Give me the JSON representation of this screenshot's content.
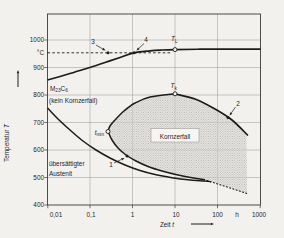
{
  "colors": {
    "background": "#f2f1ee",
    "frame": "#3b3b3b",
    "grid": "#8c8c8c",
    "curve": "#1c1c1c",
    "halftone_dot": "#a8a7a3",
    "halftone_bg": "#e6e5e1",
    "label_box_bg": "#f6f5f2"
  },
  "axes": {
    "x": {
      "label": "Zeit t",
      "unit": "h",
      "scale": "log",
      "tick_labels": [
        "0,01",
        "0,1",
        "1",
        "10",
        "100",
        "1000"
      ]
    },
    "y": {
      "label": "Temperatur T",
      "unit": "°C",
      "scale": "linear",
      "tick_labels": [
        "1000",
        "900",
        "800",
        "700",
        "600",
        "500",
        "400"
      ]
    }
  },
  "chart_data": {
    "type": "line",
    "title": "",
    "xlabel": "Zeit t",
    "x_unit": "h",
    "x_scale": "log",
    "xlim": [
      0.01,
      1000
    ],
    "ylabel": "Temperatur T",
    "y_unit": "°C",
    "ylim": [
      400,
      1100
    ],
    "grid": true,
    "series": [
      {
        "name": "M23C6-Loesungsgrenze (obere Kurve, kein Kornzerfall)",
        "style": "solid",
        "points": [
          [
            0.01,
            855
          ],
          [
            0.04,
            885
          ],
          [
            0.1,
            900
          ],
          [
            0.3,
            925
          ],
          [
            1.1,
            950
          ],
          [
            2.5,
            960
          ],
          [
            10,
            962
          ],
          [
            100,
            963
          ],
          [
            1000,
            963
          ]
        ]
      },
      {
        "name": "Loesungsgluehtemperatur ca. 950 °C (gestrichelte Linie)",
        "style": "dashed",
        "points": [
          [
            0.01,
            950
          ],
          [
            8,
            950
          ]
        ]
      },
      {
        "name": "Grenze uebersaettigter Austenit",
        "style": "solid",
        "points": [
          [
            0.01,
            753
          ],
          [
            0.018,
            713
          ],
          [
            0.034,
            673
          ],
          [
            0.068,
            633
          ],
          [
            0.14,
            600
          ],
          [
            0.3,
            571
          ],
          [
            0.66,
            545
          ],
          [
            1.5,
            525
          ],
          [
            3.4,
            511
          ],
          [
            8.5,
            499
          ],
          [
            20,
            492
          ],
          [
            51,
            487
          ]
        ]
      },
      {
        "name": "Kornzerfall-Grenzkurve 1 (C-Kurve mit Nase t_min)",
        "style": "solid",
        "points": [
          [
            10,
            804
          ],
          [
            2.6,
            793
          ],
          [
            1.15,
            771
          ],
          [
            0.63,
            742
          ],
          [
            0.39,
            709
          ],
          [
            0.3,
            687
          ],
          [
            0.27,
            667
          ],
          [
            0.33,
            636
          ],
          [
            0.46,
            607
          ],
          [
            0.7,
            582
          ],
          [
            1.2,
            560
          ],
          [
            2.3,
            540
          ],
          [
            5,
            524
          ],
          [
            12,
            509
          ],
          [
            25,
            499
          ],
          [
            51,
            492
          ]
        ]
      },
      {
        "name": "Kornzerfall-Grenzkurve 2 (rechte Flanke)",
        "style": "solid",
        "points": [
          [
            10,
            804
          ],
          [
            30,
            785
          ],
          [
            87,
            749
          ],
          [
            218,
            709
          ],
          [
            520,
            653
          ]
        ]
      },
      {
        "name": "untere Grenze (punktiert)",
        "style": "dotted",
        "points": [
          [
            70,
            485
          ],
          [
            500,
            442
          ]
        ]
      }
    ],
    "annotations": [
      {
        "label": "3",
        "t_h": 0.25,
        "T_C": 950,
        "marker": "filled-dot"
      },
      {
        "label": "4",
        "t_h": 1.1,
        "T_C": 950,
        "marker": "filled-dot"
      },
      {
        "label": "T_L",
        "t_h": 10,
        "T_C": 962,
        "marker": "open-circle"
      },
      {
        "label": "T_k",
        "t_h": 10,
        "T_C": 804,
        "marker": "open-circle"
      },
      {
        "label": "t_min",
        "t_h": 0.27,
        "T_C": 667,
        "marker": "open-circle"
      },
      {
        "label": "1",
        "t_h": 0.74,
        "T_C": 578,
        "marker": "filled-dot"
      },
      {
        "label": "2",
        "t_h": 177,
        "T_C": 718,
        "marker": "filled-dot"
      },
      {
        "label": "M23C6",
        "kind": "phase-label"
      },
      {
        "label": "(kein Kornzerfall)",
        "kind": "region-label"
      },
      {
        "label": "Kornzerfall",
        "kind": "region-label-boxed"
      },
      {
        "label": "übersättigter Austenit",
        "kind": "region-label"
      }
    ]
  },
  "figure": {
    "width": 284,
    "height": 238,
    "plot": {
      "x0": 47.5,
      "y0": 14,
      "x1": 260.5,
      "y1": 205
    },
    "grid_x": [
      90,
      132.5,
      175,
      217.5
    ],
    "grid_y": [
      40,
      67.5,
      95,
      122.5,
      150,
      177.5
    ],
    "xticks": [
      {
        "x": 56,
        "label": "0,01",
        "tick": 47.8
      },
      {
        "x": 91,
        "label": "0,1",
        "tick": 90
      },
      {
        "x": 132.5,
        "label": "1",
        "tick": 132.5
      },
      {
        "x": 176,
        "label": "10",
        "tick": 175
      },
      {
        "x": 217.5,
        "label": "100",
        "tick": 217.5
      },
      {
        "x": 237,
        "label": "h"
      },
      {
        "x": 259,
        "label": "1000",
        "tick": 260.2
      }
    ],
    "yticks": [
      {
        "y": 40,
        "label": "1000",
        "tick": 1
      },
      {
        "y": 53,
        "label": "°C"
      },
      {
        "y": 67.5,
        "label": "900",
        "tick": 1
      },
      {
        "y": 95,
        "label": "800",
        "tick": 1
      },
      {
        "y": 122.5,
        "label": "700",
        "tick": 1
      },
      {
        "y": 150,
        "label": "600",
        "tick": 1
      },
      {
        "y": 177.5,
        "label": "500",
        "tick": 1
      },
      {
        "y": 205,
        "label": "400",
        "tick": 1
      }
    ],
    "curves": [
      {
        "name": "upper-solvus-curve",
        "stroke": 1.7,
        "smooth": true,
        "points": [
          [
            47.5,
            80
          ],
          [
            60,
            76.5
          ],
          [
            75,
            72
          ],
          [
            90,
            67.5
          ],
          [
            105,
            62.5
          ],
          [
            120,
            57.5
          ],
          [
            134,
            52.8
          ],
          [
            150,
            50.8
          ],
          [
            162,
            50
          ],
          [
            175,
            49.6
          ],
          [
            200,
            49.2
          ],
          [
            230,
            49.2
          ],
          [
            260.5,
            49.2
          ]
        ]
      },
      {
        "name": "solution-temperature-dashed-line",
        "stroke": 0.9,
        "dash": "2.6,2.2",
        "points": [
          [
            47.5,
            52.8
          ],
          [
            171,
            52.8
          ]
        ]
      },
      {
        "name": "supersaturated-austenite-curve",
        "stroke": 1.5,
        "smooth": true,
        "points": [
          [
            47.5,
            108
          ],
          [
            58,
            119
          ],
          [
            70,
            130
          ],
          [
            83,
            141
          ],
          [
            96,
            150
          ],
          [
            110,
            158
          ],
          [
            125,
            165
          ],
          [
            140,
            170.5
          ],
          [
            155,
            174.5
          ],
          [
            172,
            177.7
          ],
          [
            188,
            179.8
          ],
          [
            205,
            181
          ],
          [
            211,
            181.8
          ]
        ]
      },
      {
        "name": "c-curve-left-flank",
        "stroke": 1.5,
        "smooth": true,
        "points": [
          [
            175,
            93.8
          ],
          [
            150,
            97
          ],
          [
            135,
            103
          ],
          [
            124,
            111
          ],
          [
            115,
            120
          ],
          [
            110,
            126
          ],
          [
            108,
            131.5
          ]
        ]
      },
      {
        "name": "c-curve-lower-branch",
        "stroke": 1.5,
        "smooth": true,
        "points": [
          [
            108,
            131.5
          ],
          [
            112,
            140
          ],
          [
            118,
            148
          ],
          [
            126,
            155
          ],
          [
            136,
            161
          ],
          [
            148,
            166.5
          ],
          [
            162,
            171
          ],
          [
            178,
            175
          ],
          [
            192,
            177.8
          ],
          [
            205,
            179.8
          ]
        ]
      },
      {
        "name": "c-curve-right-flank",
        "stroke": 1.7,
        "smooth": true,
        "points": [
          [
            175,
            93.8
          ],
          [
            195,
            99
          ],
          [
            215,
            109
          ],
          [
            232,
            120
          ],
          [
            248,
            135.5
          ]
        ]
      },
      {
        "name": "dotted-lower-extension",
        "stroke": 1.1,
        "dash": "1,2.4",
        "cap": "round",
        "points": [
          [
            207,
            180.5
          ],
          [
            224,
            186
          ],
          [
            247,
            193.5
          ]
        ]
      }
    ],
    "region": {
      "name": "kornzerfall-shaded-region",
      "lower_curve_index": 4,
      "right_flank_index": 5,
      "left_flank_index": 3,
      "corners_after_lower": [
        [
          247,
          193.5
        ],
        [
          246.5,
          136
        ]
      ]
    },
    "labels": [
      {
        "x": 93,
        "y": 43.5,
        "anchor": "middle",
        "parts": [
          {
            "t": "3"
          }
        ]
      },
      {
        "x": 146,
        "y": 41.5,
        "anchor": "middle",
        "parts": [
          {
            "t": "4"
          }
        ]
      },
      {
        "x": 171,
        "y": 41,
        "anchor": "start",
        "parts": [
          {
            "t": "T",
            "i": 1
          },
          {
            "t": "L",
            "sub": 1
          }
        ]
      },
      {
        "x": 170.5,
        "y": 88,
        "anchor": "start",
        "parts": [
          {
            "t": "T",
            "i": 1
          },
          {
            "t": "k",
            "sub": 1
          }
        ]
      },
      {
        "x": 104,
        "y": 134.5,
        "anchor": "end",
        "parts": [
          {
            "t": "t",
            "i": 1
          },
          {
            "t": "min",
            "sub": 1
          }
        ]
      },
      {
        "x": 111,
        "y": 166.5,
        "anchor": "middle",
        "parts": [
          {
            "t": "1"
          }
        ]
      },
      {
        "x": 238,
        "y": 105.5,
        "anchor": "middle",
        "parts": [
          {
            "t": "2"
          }
        ]
      },
      {
        "x": 50,
        "y": 90.5,
        "anchor": "start",
        "parts": [
          {
            "t": "M"
          },
          {
            "t": "23",
            "sub": 1
          },
          {
            "t": "C"
          },
          {
            "t": "6",
            "sub": 1
          }
        ]
      },
      {
        "x": 49,
        "y": 103,
        "anchor": "start",
        "parts": [
          {
            "t": "(kein Kornzerfall)"
          }
        ]
      },
      {
        "x": 49,
        "y": 166,
        "anchor": "start",
        "parts": [
          {
            "t": "übersättigter"
          }
        ]
      },
      {
        "x": 49,
        "y": 176,
        "anchor": "start",
        "parts": [
          {
            "t": "Austenit"
          }
        ]
      },
      {
        "x": 175,
        "y": 138.5,
        "anchor": "middle",
        "box": [
          151,
          128.5,
          48,
          13.5
        ],
        "parts": [
          {
            "t": "Kornzerfall"
          }
        ]
      },
      {
        "x": 167,
        "y": 226.5,
        "anchor": "middle",
        "parts": [
          {
            "t": "Zeit  "
          },
          {
            "t": "t",
            "i": 1
          }
        ]
      },
      {
        "x": 9,
        "y": 143,
        "anchor": "middle",
        "rotate": -90,
        "parts": [
          {
            "t": "Temperatur  "
          },
          {
            "t": "T",
            "i": 1
          }
        ]
      }
    ],
    "leaders": [
      {
        "name": "leader-3",
        "from": [
          96,
          45
        ],
        "to": [
          105.5,
          50.6
        ]
      },
      {
        "name": "leader-4",
        "from": [
          144,
          43.5
        ],
        "to": [
          136.5,
          50.6
        ]
      },
      {
        "name": "leader-1",
        "from": [
          114,
          163
        ],
        "to": [
          124.5,
          158
        ]
      },
      {
        "name": "leader-2",
        "from": [
          235.5,
          107
        ],
        "to": [
          229.5,
          115.5
        ]
      },
      {
        "name": "x-axis-arrow",
        "from": [
          191,
          224
        ],
        "to": [
          214,
          224
        ],
        "stroke": 1
      },
      {
        "name": "y-axis-arrow",
        "from": [
          18,
          87
        ],
        "to": [
          18,
          70
        ],
        "stroke": 1
      }
    ],
    "markers": [
      {
        "type": "dot",
        "x": 108,
        "y": 52.8,
        "name": "point-3-dot"
      },
      {
        "type": "dot",
        "x": 134,
        "y": 52.8,
        "name": "point-4-dot"
      },
      {
        "type": "dot",
        "x": 127,
        "y": 156,
        "name": "point-1-dot"
      },
      {
        "type": "dot",
        "x": 228,
        "y": 117.5,
        "name": "point-2-dot"
      },
      {
        "type": "circle",
        "x": 175,
        "y": 49.6,
        "name": "TL-open-circle"
      },
      {
        "type": "circle",
        "x": 175,
        "y": 93.8,
        "name": "Tk-open-circle"
      },
      {
        "type": "circle",
        "x": 108,
        "y": 131.5,
        "name": "tmin-open-circle"
      }
    ]
  }
}
